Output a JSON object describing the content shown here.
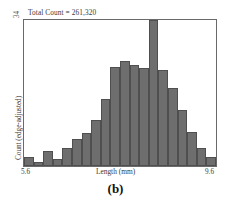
{
  "figure": {
    "caption": "(b)",
    "title_annotation": "Total Count = 261,320"
  },
  "axes": {
    "x_title": "Length (mm)",
    "x_tick_left": "5.6",
    "x_tick_right": "9.6",
    "y_title": "Count (edge-adjusted)",
    "y_tick_top": "34"
  },
  "style": {
    "bar_fill": "#6e6e6e",
    "bar_edge": "#4f4f4f",
    "frame": "#6a6a6a",
    "text": "#3a3a3a"
  },
  "chart_data": {
    "type": "bar",
    "title": "Total Count = 261,320",
    "xlabel": "Length (mm)",
    "ylabel": "Count (edge-adjusted)",
    "xlim": [
      5.6,
      9.6
    ],
    "ylim": [
      0,
      34
    ],
    "grid": false,
    "legend": null,
    "bin_width": 0.2,
    "categories": [
      "5.6-5.8",
      "5.8-6.0",
      "6.0-6.2",
      "6.2-6.4",
      "6.4-6.6",
      "6.6-6.8",
      "6.8-7.0",
      "7.0-7.2",
      "7.2-7.4",
      "7.4-7.6",
      "7.6-7.8",
      "7.8-8.0",
      "8.0-8.2",
      "8.2-8.4",
      "8.4-8.6",
      "8.6-8.8",
      "8.8-9.0",
      "9.0-9.2",
      "9.2-9.4",
      "9.4-9.6"
    ],
    "bin_centers": [
      5.7,
      5.9,
      6.1,
      6.3,
      6.5,
      6.7,
      6.9,
      7.1,
      7.3,
      7.5,
      7.7,
      7.9,
      8.1,
      8.3,
      8.5,
      8.7,
      8.9,
      9.1,
      9.3,
      9.5
    ],
    "values": [
      2.0,
      0.9,
      3.4,
      1.6,
      4.3,
      6.2,
      7.8,
      10.8,
      15.5,
      23.0,
      24.5,
      23.5,
      22.8,
      34.0,
      22.3,
      18.2,
      13.0,
      8.0,
      4.2,
      2.2
    ]
  }
}
